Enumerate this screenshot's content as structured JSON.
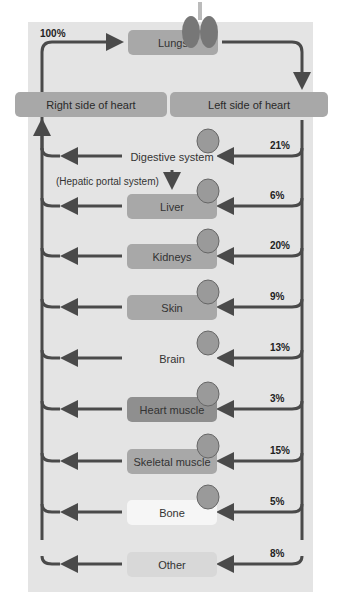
{
  "diagram": {
    "top_label": "100%",
    "lungs": {
      "label": "Lungs",
      "icon": "lungs-icon"
    },
    "heart": {
      "right": "Right side of heart",
      "left": "Left side of heart"
    },
    "hepatic_note": "(Hepatic portal system)",
    "organs": [
      {
        "label": "Digestive system",
        "pct": "21%",
        "icon": "stomach-icon"
      },
      {
        "label": "Liver",
        "pct": "6%",
        "icon": "liver-icon"
      },
      {
        "label": "Kidneys",
        "pct": "20%",
        "icon": "kidney-icon"
      },
      {
        "label": "Skin",
        "pct": "9%",
        "icon": "skin-icon"
      },
      {
        "label": "Brain",
        "pct": "13%",
        "icon": "brain-icon"
      },
      {
        "label": "Heart muscle",
        "pct": "3%",
        "icon": "heart-icon"
      },
      {
        "label": "Skeletal muscle",
        "pct": "15%",
        "icon": "muscle-icon"
      },
      {
        "label": "Bone",
        "pct": "5%",
        "icon": "bone-icon"
      },
      {
        "label": "Other",
        "pct": "8%",
        "icon": ""
      }
    ]
  },
  "chart_data": {
    "type": "flow",
    "categories": [
      "Digestive system",
      "Liver",
      "Kidneys",
      "Skin",
      "Brain",
      "Heart muscle",
      "Skeletal muscle",
      "Bone",
      "Other"
    ],
    "values": [
      21,
      6,
      20,
      9,
      13,
      3,
      15,
      5,
      8
    ],
    "total": 100
  }
}
